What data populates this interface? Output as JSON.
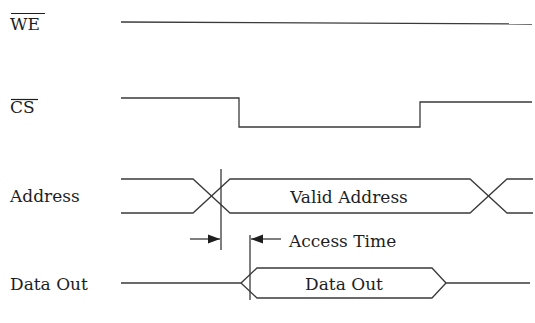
{
  "diagram": {
    "type": "timing-diagram",
    "signals": [
      {
        "id": "we",
        "label": "WE",
        "active_low": true,
        "waveform": "constant high"
      },
      {
        "id": "cs",
        "label": "CS",
        "active_low": true,
        "waveform": "high, falls low, returns high"
      },
      {
        "id": "address",
        "label": "Address",
        "active_low": false,
        "waveform": "bus transition to valid then transition out",
        "bus_label": "Valid Address"
      },
      {
        "id": "data_out",
        "label": "Data Out",
        "active_low": false,
        "waveform": "high-Z then valid data then high-Z",
        "bus_label": "Data Out"
      }
    ],
    "annotations": [
      {
        "id": "access_time",
        "label": "Access Time",
        "from": "address valid",
        "to": "data out valid"
      }
    ]
  },
  "colors": {
    "line": "#3a3a3a",
    "text": "#1e1e1e",
    "background": "#ffffff"
  }
}
